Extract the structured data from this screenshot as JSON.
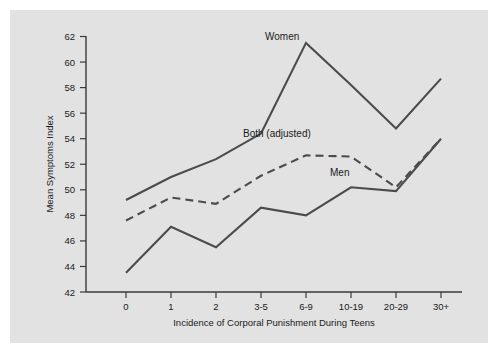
{
  "chart_data": {
    "type": "line",
    "title": "",
    "xlabel": "Incidence of Corporal Punishment During Teens",
    "ylabel": "Mean Symptoms Index",
    "categories": [
      "0",
      "1",
      "2",
      "3-5",
      "6-9",
      "10-19",
      "20-29",
      "30+"
    ],
    "ylim": [
      42,
      62
    ],
    "yticks": [
      42,
      44,
      46,
      48,
      50,
      52,
      54,
      56,
      58,
      60,
      62
    ],
    "grid": false,
    "legend_position": "inline-annotations",
    "series": [
      {
        "name": "Women",
        "style": "solid",
        "color": "#4b4b4b",
        "values": [
          49.2,
          51.0,
          52.4,
          54.4,
          61.5,
          58.2,
          54.8,
          58.7
        ]
      },
      {
        "name": "Both (adjusted)",
        "style": "dashed",
        "color": "#4b4b4b",
        "values": [
          47.6,
          49.4,
          48.9,
          51.1,
          52.7,
          52.6,
          50.2,
          54.0
        ]
      },
      {
        "name": "Men",
        "style": "solid",
        "color": "#4b4b4b",
        "values": [
          43.5,
          47.1,
          45.5,
          48.6,
          48.0,
          50.2,
          49.9,
          54.0
        ]
      }
    ],
    "annotations": [
      {
        "text": "Women",
        "series": "Women"
      },
      {
        "text": "Both (adjusted)",
        "series": "Both (adjusted)"
      },
      {
        "text": "Men",
        "series": "Men"
      }
    ]
  },
  "axis": {
    "y_tick_labels": [
      "62",
      "60",
      "58",
      "56",
      "54",
      "52",
      "50",
      "48",
      "46",
      "44",
      "42"
    ],
    "x_tick_labels": [
      "0",
      "1",
      "2",
      "3-5",
      "6-9",
      "10-19",
      "20-29",
      "30+"
    ],
    "y_title": "Mean Symptoms Index",
    "x_title": "Incidence of Corporal Punishment During Teens"
  },
  "labels": {
    "women": "Women",
    "both": "Both (adjusted)",
    "men": "Men"
  },
  "colors": {
    "panel_background": "#e2e2e2",
    "figure_background": "#ffffff",
    "line": "#4b4b4b",
    "axis": "#3a3a3a",
    "text": "#1a1a1a"
  }
}
